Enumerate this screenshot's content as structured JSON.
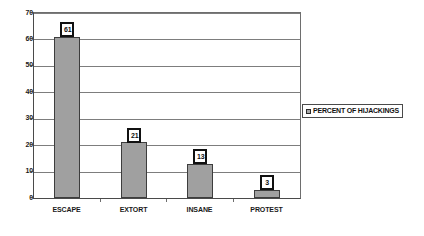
{
  "chart_data": {
    "type": "bar",
    "title": "",
    "subtitle": "",
    "xlabel": "",
    "ylabel": "",
    "categories": [
      "ESCAPE",
      "EXTORT",
      "INSANE",
      "PROTEST"
    ],
    "values": [
      61,
      21,
      13,
      3
    ],
    "series": [
      {
        "name": "PERCENT OF HIJACKINGS",
        "values": [
          61,
          21,
          13,
          3
        ]
      }
    ],
    "ylim": [
      0,
      70
    ],
    "yticks": [
      0,
      10,
      20,
      30,
      40,
      50,
      60,
      70
    ],
    "ytick_labels": [
      "0",
      "10",
      "20",
      "30",
      "40",
      "50",
      "60",
      "70"
    ],
    "grid": true,
    "grid_axis": "y",
    "legend": {
      "position": "right",
      "entries": [
        {
          "label": "PERCENT OF HIJACKINGS",
          "marker": "legend-swatch-icon",
          "color": "#a8a8a8"
        }
      ]
    },
    "data_labels": [
      "61",
      "21",
      "13",
      "3"
    ],
    "colors": {
      "bar_fill": "#a0a0a0",
      "bar_border": "#3d3d3d",
      "gridline": "#7d7d7d",
      "axis": "#4a4a4a",
      "text": "#1a1a1a",
      "background": "#ffffff",
      "label_box_border": "#111111"
    }
  }
}
